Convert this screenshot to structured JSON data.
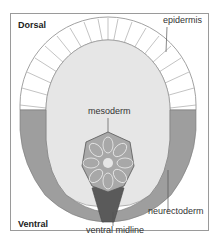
{
  "diagram": {
    "corner_labels": {
      "top_left": "Dorsal",
      "bottom_left": "Ventral"
    },
    "callouts": {
      "epidermis": "epidermis",
      "mesoderm": "mesoderm",
      "neurectoderm": "neurectoderm",
      "ventral_midline": "ventral midline"
    },
    "colors": {
      "frame": "#9a9a9a",
      "epidermis_fill": "#ffffff",
      "cell_outline": "#8a8a8a",
      "interior_fill": "#e6e6e6",
      "neurectoderm_fill": "#9e9e9e",
      "mesoderm_fill": "#a8a8a8",
      "ventral_midline_fill": "#5a5a5a"
    }
  }
}
